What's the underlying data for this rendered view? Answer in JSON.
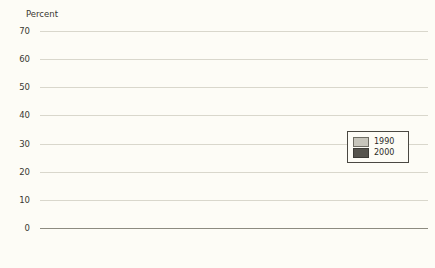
{
  "chart_data": {
    "type": "bar",
    "title": "",
    "xlabel": "",
    "ylabel": "Percent",
    "ylim": [
      0,
      70
    ],
    "yticks": [
      0,
      10,
      20,
      30,
      40,
      50,
      60,
      70
    ],
    "grid": true,
    "legend_position": "right-inside",
    "categories": [
      "White",
      "Black",
      "Latino",
      "Asian"
    ],
    "groups": [
      {
        "label": "Less than High School",
        "categories": [
          "White",
          "Black",
          "Latino",
          "Asian"
        ],
        "series": [
          {
            "name": "1990",
            "values": [
              24,
              46,
              44,
              25
            ]
          },
          {
            "name": "2000",
            "values": [
              32,
              60,
              54,
              39
            ]
          }
        ]
      },
      {
        "label": "High School",
        "categories": [
          "White",
          "Black",
          "Latino",
          "Asian"
        ],
        "series": [
          {
            "name": "1990",
            "values": [
              10,
              31,
              24,
              19
            ]
          },
          {
            "name": "2000",
            "values": [
              15,
              37,
              31,
              17
            ]
          }
        ]
      },
      {
        "label": "Some College",
        "categories": [
          "White",
          "Black",
          "Latino",
          "Asian"
        ],
        "series": [
          {
            "name": "1990",
            "values": [
              7,
              18,
              14,
              18
            ]
          },
          {
            "name": "2000",
            "values": [
              11,
              26,
              25,
              27
            ]
          }
        ]
      },
      {
        "label": "BA or Better",
        "categories": [
          "White",
          "Black",
          "Latino",
          "Asian"
        ],
        "series": [
          {
            "name": "1990",
            "values": [
              5,
              11,
              9,
              17
            ]
          },
          {
            "name": "2000",
            "values": [
              8,
              15,
              17,
              16
            ]
          }
        ]
      }
    ],
    "series_names": [
      "1990",
      "2000"
    ],
    "colors": {
      "1990": "#c7c5bb",
      "2000": "#56544d",
      "background": "#fdfcf6",
      "gridline": "#d9d7cc",
      "axis": "#8d8b80",
      "text": "#3a3832"
    }
  },
  "legend": {
    "items": [
      {
        "label": "1990",
        "swatch": "1990"
      },
      {
        "label": "2000",
        "swatch": "2000"
      }
    ]
  }
}
